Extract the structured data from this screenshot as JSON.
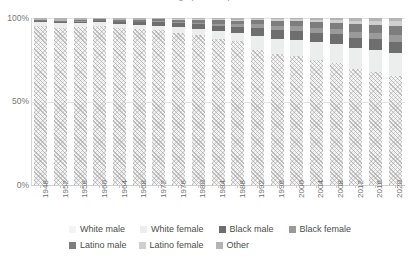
{
  "chart_data": {
    "type": "bar",
    "title": "Demographic composition",
    "subtitle": "",
    "xlabel": "",
    "ylabel": "",
    "stacked": true,
    "normalized_percent": true,
    "grid": true,
    "legend_position": "bottom",
    "ylim": [
      0,
      100
    ],
    "yticks": [
      "0%",
      "50%",
      "100%"
    ],
    "ytick_values": [
      0,
      50,
      100
    ],
    "categories": [
      "1948",
      "1952",
      "1956",
      "1960",
      "1964",
      "1968",
      "1972",
      "1976",
      "1980",
      "1984",
      "1988",
      "1992",
      "1996",
      "2000",
      "2004",
      "2008",
      "2012",
      "2016",
      "2020"
    ],
    "series": [
      {
        "name": "White male",
        "color": "#f4f4f4",
        "values": [
          95.3,
          94.2,
          94.8,
          95.4,
          93.8,
          93.6,
          92.7,
          91.0,
          89.8,
          87.4,
          86.0,
          80.8,
          78.5,
          77.0,
          75.1,
          73.0,
          69.4,
          67.8,
          65.2
        ]
      },
      {
        "name": "White female",
        "color": "#eceded",
        "values": [
          2.3,
          2.6,
          2.4,
          2.0,
          2.6,
          2.3,
          2.6,
          3.4,
          3.6,
          4.8,
          5.2,
          8.2,
          9.2,
          9.8,
          10.4,
          11.2,
          12.6,
          13.0,
          14.1
        ]
      },
      {
        "name": "Black male",
        "color": "#6e6e6e",
        "values": [
          0.4,
          0.6,
          0.6,
          0.8,
          1.1,
          1.5,
          2.1,
          2.6,
          2.8,
          3.2,
          3.6,
          5.1,
          5.4,
          5.6,
          5.8,
          6.1,
          6.3,
          6.4,
          6.6
        ]
      },
      {
        "name": "Black female",
        "color": "#9a9a9a",
        "values": [
          0.0,
          0.2,
          0.2,
          0.2,
          0.4,
          0.4,
          0.8,
          0.9,
          1.1,
          1.3,
          1.5,
          2.1,
          2.4,
          2.6,
          2.8,
          3.0,
          3.6,
          3.8,
          4.2
        ]
      },
      {
        "name": "Latino male",
        "color": "#7d7d7d",
        "values": [
          0.8,
          0.9,
          0.9,
          0.8,
          1.0,
          1.1,
          1.0,
          1.2,
          1.7,
          2.0,
          2.2,
          2.6,
          3.0,
          3.2,
          3.4,
          3.8,
          4.3,
          4.6,
          5.0
        ]
      },
      {
        "name": "Latino female",
        "color": "#cfcfcf",
        "values": [
          0.0,
          0.0,
          0.0,
          0.0,
          0.0,
          0.2,
          0.2,
          0.2,
          0.3,
          0.5,
          0.6,
          0.8,
          1.0,
          1.2,
          1.4,
          1.6,
          2.2,
          2.6,
          3.0
        ]
      },
      {
        "name": "Other",
        "color": "#b4b4b4",
        "values": [
          1.2,
          1.5,
          1.1,
          0.8,
          1.1,
          0.9,
          0.6,
          0.7,
          0.7,
          0.8,
          0.9,
          0.4,
          0.5,
          0.6,
          1.1,
          1.3,
          1.6,
          1.8,
          1.9
        ]
      }
    ]
  },
  "legend": {
    "row1": [
      {
        "label": "White male",
        "swatch": "#f4f4f4"
      },
      {
        "label": "White female",
        "swatch": "#eceded"
      },
      {
        "label": "Black male",
        "swatch": "#6e6e6e"
      },
      {
        "label": "Black female",
        "swatch": "#9a9a9a"
      }
    ],
    "row2": [
      {
        "label": "Latino male",
        "swatch": "#7d7d7d"
      },
      {
        "label": "Latino female",
        "swatch": "#cfcfcf"
      },
      {
        "label": "Other",
        "swatch": "#b4b4b4"
      }
    ]
  }
}
